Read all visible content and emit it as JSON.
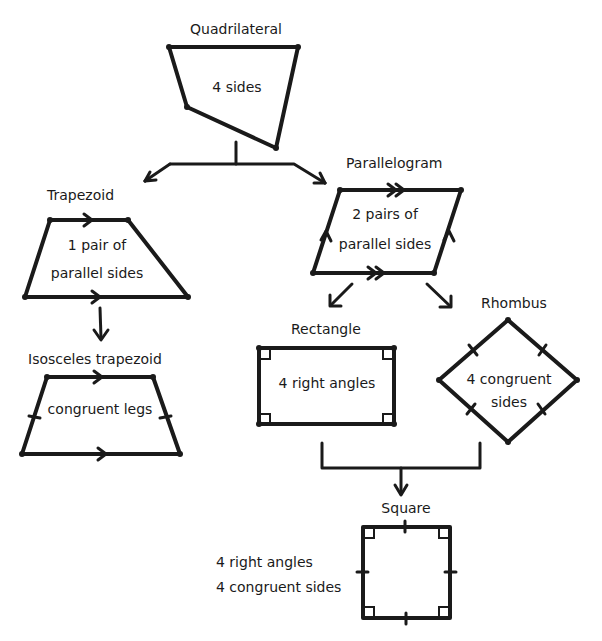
{
  "nodes": {
    "quadrilateral": {
      "title": "Quadrilateral",
      "desc": "4 sides"
    },
    "trapezoid": {
      "title": "Trapezoid",
      "desc_line1": "1 pair of",
      "desc_line2": "parallel sides"
    },
    "parallelogram": {
      "title": "Parallelogram",
      "desc_line1": "2 pairs of",
      "desc_line2": "parallel sides"
    },
    "isosceles_trapezoid": {
      "title": "Isosceles trapezoid",
      "desc": "congruent legs"
    },
    "rectangle": {
      "title": "Rectangle",
      "desc": "4 right angles"
    },
    "rhombus": {
      "title": "Rhombus",
      "desc_line1": "4 congruent",
      "desc_line2": "sides"
    },
    "square": {
      "title": "Square",
      "desc_line1": "4 right angles",
      "desc_line2": "4 congruent sides"
    }
  },
  "edges": [
    {
      "from": "Quadrilateral",
      "to": "Trapezoid"
    },
    {
      "from": "Quadrilateral",
      "to": "Parallelogram"
    },
    {
      "from": "Trapezoid",
      "to": "Isosceles trapezoid"
    },
    {
      "from": "Parallelogram",
      "to": "Rectangle"
    },
    {
      "from": "Parallelogram",
      "to": "Rhombus"
    },
    {
      "from": "Rectangle",
      "to": "Square"
    },
    {
      "from": "Rhombus",
      "to": "Square"
    }
  ],
  "colors": {
    "ink": "#1a1a1a",
    "background": "#ffffff"
  }
}
